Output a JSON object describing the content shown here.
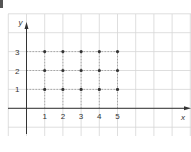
{
  "chart_data": {
    "type": "scatter",
    "title": "",
    "xlabel": "x",
    "ylabel": "y",
    "x_ticks": [
      "1",
      "2",
      "3",
      "4",
      "5"
    ],
    "y_ticks": [
      "1",
      "2",
      "3"
    ],
    "xlim": [
      -1,
      8
    ],
    "ylim": [
      -1,
      5
    ],
    "grid": true,
    "guide_lines": "dashed",
    "points": [
      {
        "x": 1,
        "y": 1
      },
      {
        "x": 2,
        "y": 1
      },
      {
        "x": 3,
        "y": 1
      },
      {
        "x": 4,
        "y": 1
      },
      {
        "x": 5,
        "y": 1
      },
      {
        "x": 1,
        "y": 2
      },
      {
        "x": 2,
        "y": 2
      },
      {
        "x": 3,
        "y": 2
      },
      {
        "x": 4,
        "y": 2
      },
      {
        "x": 5,
        "y": 2
      },
      {
        "x": 1,
        "y": 3
      },
      {
        "x": 2,
        "y": 3
      },
      {
        "x": 3,
        "y": 3
      },
      {
        "x": 4,
        "y": 3
      },
      {
        "x": 5,
        "y": 3
      }
    ],
    "colors": {
      "grid": "#d6d6d6",
      "axis": "#333333",
      "point": "#333333",
      "guide": "#999999"
    }
  }
}
